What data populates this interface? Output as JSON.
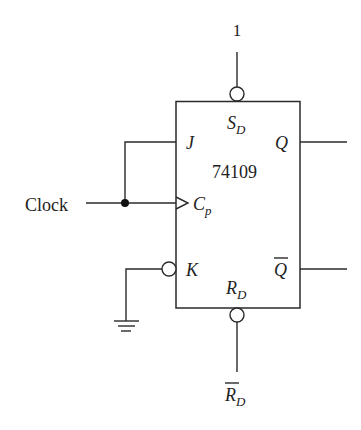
{
  "diagram": {
    "type": "JK flip-flop circuit",
    "chip_label": "74109",
    "inputs": {
      "clock_label": "Clock",
      "set_input_value": "1",
      "reset_label": "R",
      "reset_subscript": "D"
    },
    "pins": {
      "set": {
        "label": "S",
        "subscript": "D"
      },
      "j": {
        "label": "J"
      },
      "clock": {
        "label": "C",
        "subscript": "p"
      },
      "k": {
        "label": "K"
      },
      "reset": {
        "label": "R",
        "subscript": "D"
      },
      "q": {
        "label": "Q"
      },
      "q_bar": {
        "label": "Q"
      }
    },
    "colors": {
      "line": "#2a2a2a",
      "background": "#ffffff"
    }
  }
}
